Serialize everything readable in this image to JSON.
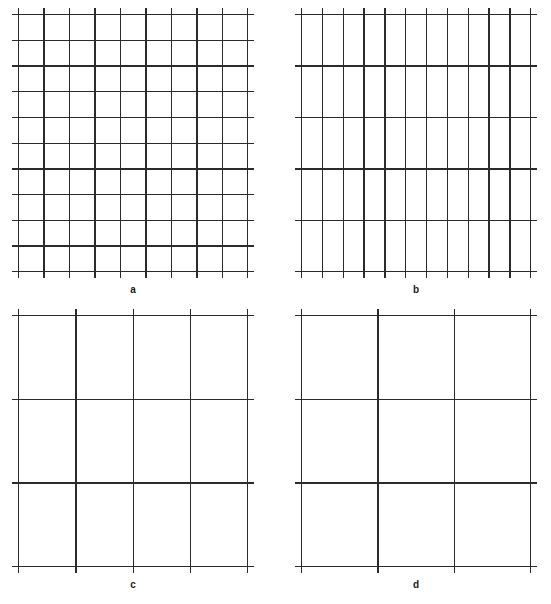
{
  "figure": {
    "background": "#ffffff",
    "line_color": "#2b2b2b",
    "label_color": "#1a1a1a"
  },
  "caption": {
    "text": "",
    "visible": "partially-cropped"
  },
  "chart_data": {
    "type": "diagram",
    "title": "",
    "panels": [
      {
        "id": "a",
        "label": "a",
        "position": "top-left",
        "x": 18,
        "y": 14,
        "width": 230,
        "height": 258,
        "vertical_lines": 10,
        "horizontal_lines": 11,
        "overhang": 6,
        "grid_density": "fine",
        "line_width": 1.4
      },
      {
        "id": "b",
        "label": "b",
        "position": "top-right",
        "x": 301,
        "y": 14,
        "width": 230,
        "height": 258,
        "vertical_lines": 12,
        "horizontal_lines": 6,
        "overhang": 6,
        "grid_density": "anisotropic",
        "line_width": 1.4
      },
      {
        "id": "c",
        "label": "c",
        "position": "bottom-left",
        "x": 18,
        "y": 315,
        "width": 230,
        "height": 252,
        "vertical_lines": 5,
        "horizontal_lines": 4,
        "overhang": 6,
        "grid_density": "coarse",
        "line_width": 1.4
      },
      {
        "id": "d",
        "label": "d",
        "position": "bottom-right",
        "x": 301,
        "y": 315,
        "width": 230,
        "height": 252,
        "vertical_lines": 4,
        "horizontal_lines": 4,
        "overhang": 6,
        "grid_density": "coarsest",
        "line_width": 1.4
      }
    ],
    "xlabel": "",
    "ylabel": "",
    "legend": [],
    "grid": true
  }
}
